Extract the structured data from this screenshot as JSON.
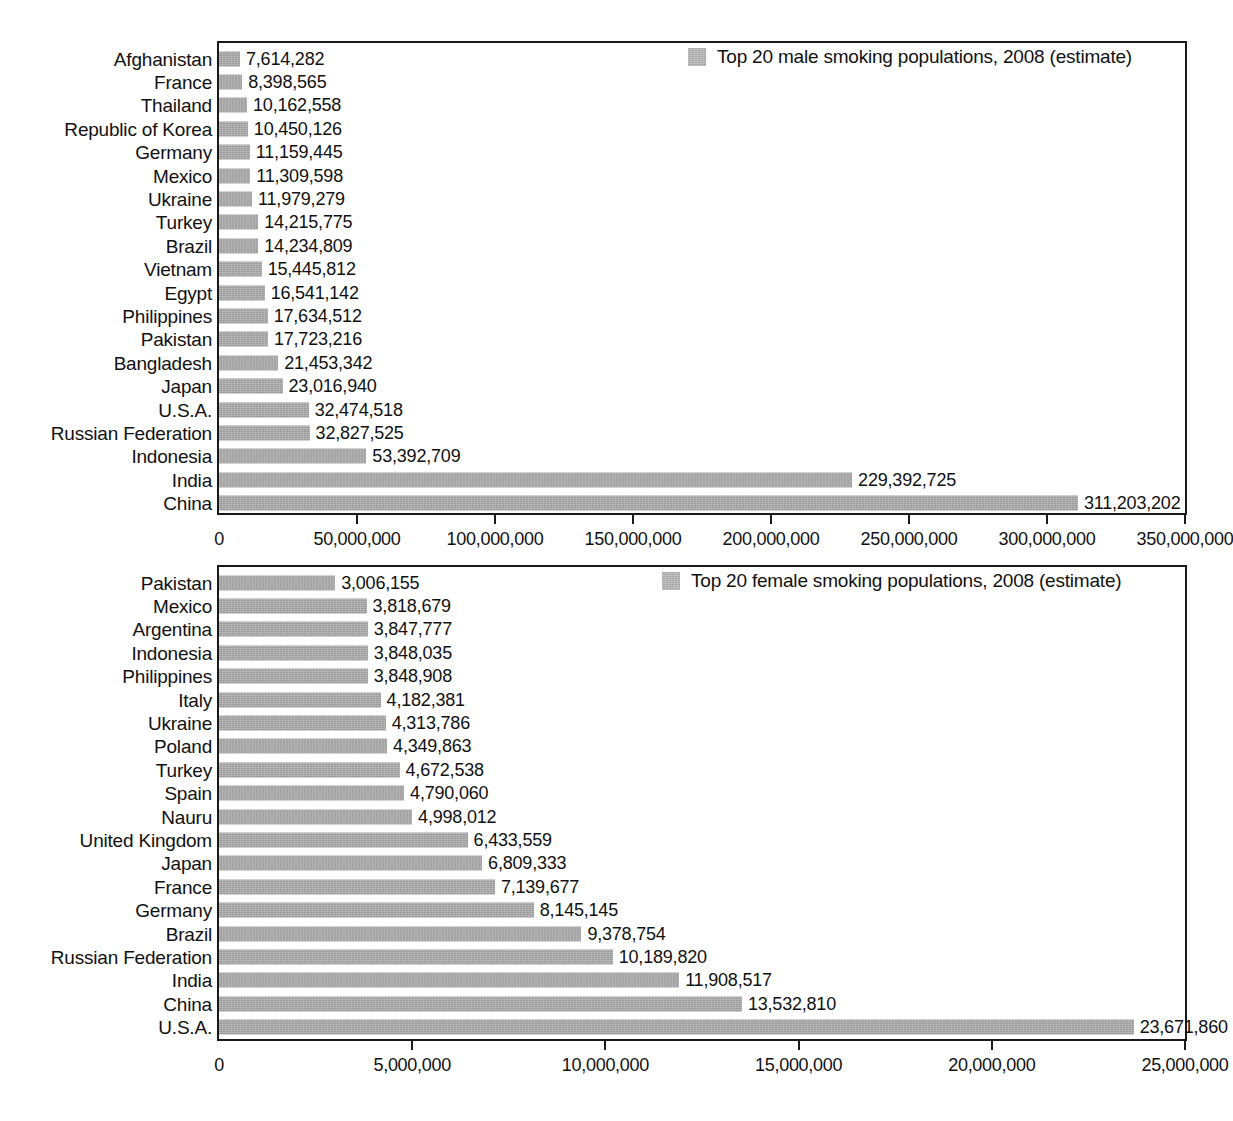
{
  "chart_data": [
    {
      "type": "bar",
      "orientation": "horizontal",
      "id": "male",
      "title": "",
      "legend": "Top 20 male smoking populations, 2008 (estimate)",
      "legend_position": "top-right inside plot",
      "legend_swatch_color": "#a7a7a7",
      "bar_color": "#9b9b9b",
      "grid": false,
      "xlabel": "",
      "ylabel": "",
      "xlim": [
        0,
        350000000
      ],
      "xticks": [
        0,
        50000000,
        100000000,
        150000000,
        200000000,
        250000000,
        300000000,
        350000000
      ],
      "xtick_labels": [
        "0",
        "50,000,000",
        "100,000,000",
        "150,000,000",
        "200,000,000",
        "250,000,000",
        "300,000,000",
        "350,000,000"
      ],
      "categories": [
        "Afghanistan",
        "France",
        "Thailand",
        "Republic of Korea",
        "Germany",
        "Mexico",
        "Ukraine",
        "Turkey",
        "Brazil",
        "Vietnam",
        "Egypt",
        "Philippines",
        "Pakistan",
        "Bangladesh",
        "Japan",
        "U.S.A.",
        "Russian Federation",
        "Indonesia",
        "India",
        "China"
      ],
      "values": [
        7614282,
        8398565,
        10162558,
        10450126,
        11159445,
        11309598,
        11979279,
        14215775,
        14234809,
        15445812,
        16541142,
        17634512,
        17723216,
        21453342,
        23016940,
        32474518,
        32827525,
        53392709,
        229392725,
        311203202
      ],
      "value_labels": [
        "7,614,282",
        "8,398,565",
        "10,162,558",
        "10,450,126",
        "11,159,445",
        "11,309,598",
        "11,979,279",
        "14,215,775",
        "14,234,809",
        "15,445,812",
        "16,541,142",
        "17,634,512",
        "17,723,216",
        "21,453,342",
        "23,016,940",
        "32,474,518",
        "32,827,525",
        "53,392,709",
        "229,392,725",
        "311,203,202"
      ]
    },
    {
      "type": "bar",
      "orientation": "horizontal",
      "id": "female",
      "title": "",
      "legend": "Top 20 female smoking populations, 2008 (estimate)",
      "legend_position": "top-right inside plot",
      "legend_swatch_color": "#a7a7a7",
      "bar_color": "#9b9b9b",
      "grid": false,
      "xlabel": "",
      "ylabel": "",
      "xlim": [
        0,
        25000000
      ],
      "xticks": [
        0,
        5000000,
        10000000,
        15000000,
        20000000,
        25000000
      ],
      "xtick_labels": [
        "0",
        "5,000,000",
        "10,000,000",
        "15,000,000",
        "20,000,000",
        "25,000,000"
      ],
      "categories": [
        "Pakistan",
        "Mexico",
        "Argentina",
        "Indonesia",
        "Philippines",
        "Italy",
        "Ukraine",
        "Poland",
        "Turkey",
        "Spain",
        "Nauru",
        "United Kingdom",
        "Japan",
        "France",
        "Germany",
        "Brazil",
        "Russian Federation",
        "India",
        "China",
        "U.S.A."
      ],
      "values": [
        3006155,
        3818679,
        3847777,
        3848035,
        3848908,
        4182381,
        4313786,
        4349863,
        4672538,
        4790060,
        4998012,
        6433559,
        6809333,
        7139677,
        8145145,
        9378754,
        10189820,
        11908517,
        13532810,
        23671860
      ],
      "value_labels": [
        "3,006,155",
        "3,818,679",
        "3,847,777",
        "3,848,035",
        "3,848,908",
        "4,182,381",
        "4,313,786",
        "4,349,863",
        "4,672,538",
        "4,790,060",
        "4,998,012",
        "6,433,559",
        "6,809,333",
        "7,139,677",
        "8,145,145",
        "9,378,754",
        "10,189,820",
        "11,908,517",
        "13,532,810",
        "23,671,860"
      ]
    }
  ]
}
